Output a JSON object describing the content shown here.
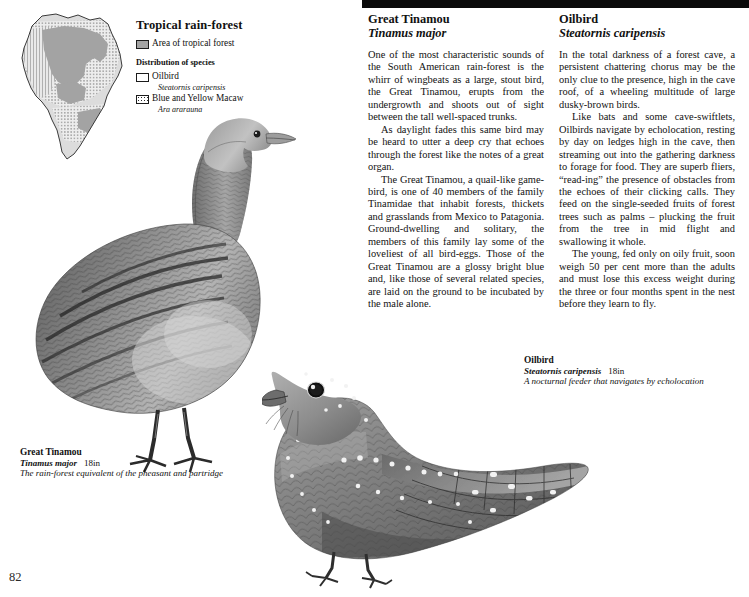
{
  "page": {
    "folio": "82"
  },
  "map": {
    "legend_title": "Tropical rain-forest",
    "forest_label": "Area of tropical forest",
    "distribution_title": "Distribution of species",
    "species": [
      {
        "name": "Oilbird",
        "sci": "Steatornis caripensis",
        "swatch": "open-box-swatch"
      },
      {
        "name": "Blue and Yellow Macaw",
        "sci": "Ara ararauna",
        "swatch": "dotted-box-swatch"
      }
    ],
    "region_name": "South America"
  },
  "articles": [
    {
      "title": "Great Tinamou",
      "sci": "Tinamus major",
      "paragraphs": [
        "One of the most characteristic sounds of the South American rain-forest is the whirr of wingbeats as a large, stout bird, the Great Tinamou, erupts from the undergrowth and shoots out of sight between the tall well-spaced trunks.",
        "As daylight fades this same bird may be heard to utter a deep cry that echoes through the forest like the notes of a great organ.",
        "The Great Tinamou, a quail-like game-bird, is one of 40 members of the family Tinamidae that inhabit forests, thickets and grasslands from Mexico to Patagonia. Ground-dwelling and solitary, the members of this family lay some of the loveliest of all bird-eggs. Those of the Great Tinamou are a glossy bright blue and, like those of several related species, are laid on the ground to be incubated by the male alone."
      ]
    },
    {
      "title": "Oilbird",
      "sci": "Steatornis caripensis",
      "paragraphs": [
        "In the total darkness of a forest cave, a persistent chattering chorus may be the only clue to the presence, high in the cave roof, of a wheeling multitude of large dusky-brown birds.",
        "Like bats and some cave-swiftlets, Oilbirds navigate by echolocation, resting by day on ledges high in the cave, then streaming out into the gathering darkness to forage for food. They are superb fliers, “read-ing” the presence of obstacles from the echoes of their clicking calls. They feed on the single-seeded fruits of forest trees such as palms – plucking the fruit from the tree in mid flight and swallowing it whole.",
        "The young, fed only on oily fruit, soon weigh 50 per cent more than the adults and must lose this excess weight during the three or four months spent in the nest before they learn to fly."
      ]
    }
  ],
  "captions": [
    {
      "name": "Great Tinamou",
      "sci": "Tinamus major",
      "size": "18in",
      "desc": "The rain-forest equivalent of the pheasant and partridge"
    },
    {
      "name": "Oilbird",
      "sci": "Steatornis caripensis",
      "size": "18in",
      "desc": "A nocturnal feeder that navigates by echolocation"
    }
  ],
  "colors": {
    "forest_gray": "#a3a3a3",
    "land_light": "#dcdcdc",
    "ink": "#111111",
    "bar_black": "#0a0a0a"
  }
}
